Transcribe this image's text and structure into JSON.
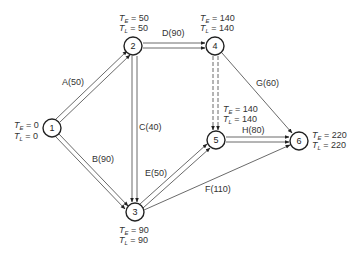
{
  "nodes": [
    {
      "id": "1",
      "label": "1",
      "x": 52,
      "y": 128,
      "TE": "0",
      "TL": "0"
    },
    {
      "id": "2",
      "label": "2",
      "x": 133,
      "y": 46,
      "TE": "50",
      "TL": "50"
    },
    {
      "id": "3",
      "label": "3",
      "x": 135,
      "y": 212,
      "TE": "90",
      "TL": "90"
    },
    {
      "id": "4",
      "label": "4",
      "x": 215,
      "y": 46,
      "TE": "140",
      "TL": "140"
    },
    {
      "id": "5",
      "label": "5",
      "x": 216,
      "y": 140,
      "TE": "140",
      "TL": "140"
    },
    {
      "id": "6",
      "label": "6",
      "x": 299,
      "y": 141,
      "TE": "220",
      "TL": "220"
    }
  ],
  "activities": [
    {
      "id": "A",
      "label": "A(50)",
      "from": "1",
      "to": "2",
      "duration": 50,
      "style": "double"
    },
    {
      "id": "B",
      "label": "B(90)",
      "from": "1",
      "to": "3",
      "duration": 90,
      "style": "double"
    },
    {
      "id": "C",
      "label": "C(40)",
      "from": "2",
      "to": "3",
      "duration": 40,
      "style": "double"
    },
    {
      "id": "D",
      "label": "D(90)",
      "from": "2",
      "to": "4",
      "duration": 90,
      "style": "double"
    },
    {
      "id": "dummy",
      "label": "",
      "from": "4",
      "to": "5",
      "duration": 0,
      "style": "double-dashed"
    },
    {
      "id": "E",
      "label": "E(50)",
      "from": "3",
      "to": "5",
      "duration": 50,
      "style": "double"
    },
    {
      "id": "F",
      "label": "F(110)",
      "from": "3",
      "to": "6",
      "duration": 110,
      "style": "single"
    },
    {
      "id": "G",
      "label": "G(60)",
      "from": "4",
      "to": "6",
      "duration": 60,
      "style": "single"
    },
    {
      "id": "H",
      "label": "H(80)",
      "from": "5",
      "to": "6",
      "duration": 80,
      "style": "double"
    }
  ],
  "labels": {
    "te_prefix": "T",
    "te_sub": "E",
    "tl_prefix": "T",
    "tl_sub": "L",
    "eq": " = "
  }
}
